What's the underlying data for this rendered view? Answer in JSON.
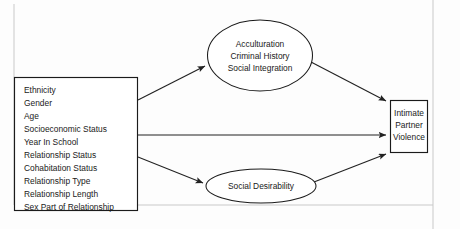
{
  "figure": {
    "kind": "conceptual-path-model-diagram",
    "predictor_box": {
      "name": "predictor-variables-box",
      "items": [
        "Ethnicity",
        "Gender",
        "Age",
        "Socioeconomic Status",
        "Year In School",
        "Relationship Status",
        "Cohabitation Status",
        "Relationship Type",
        "Relationship Length",
        "Sex Part of Relationship"
      ]
    },
    "mediator_top": {
      "name": "acculturation-ellipse",
      "lines": [
        "Acculturation",
        "Criminal History",
        "Social Integration"
      ]
    },
    "mediator_bottom": {
      "name": "social-desirability-ellipse",
      "lines": [
        "Social Desirability"
      ]
    },
    "outcome_box": {
      "name": "intimate-partner-violence-box",
      "lines": [
        "Intimate",
        "Partner",
        "Violence"
      ]
    },
    "arrows": [
      {
        "id": "predictors-to-top-mediator",
        "from": "predictor-variables-box",
        "to": "acculturation-ellipse"
      },
      {
        "id": "predictors-to-outcome",
        "from": "predictor-variables-box",
        "to": "intimate-partner-violence-box"
      },
      {
        "id": "predictors-to-bottom-mediator",
        "from": "predictor-variables-box",
        "to": "social-desirability-ellipse"
      },
      {
        "id": "top-mediator-to-outcome",
        "from": "acculturation-ellipse",
        "to": "intimate-partner-violence-box"
      },
      {
        "id": "bottom-mediator-to-outcome",
        "from": "social-desirability-ellipse",
        "to": "intimate-partner-violence-box"
      }
    ],
    "colors": {
      "stroke": "#1b1b1b",
      "text": "#1a1a1a",
      "background": "#fdfdfd",
      "frame": "#c9c9c9"
    }
  }
}
